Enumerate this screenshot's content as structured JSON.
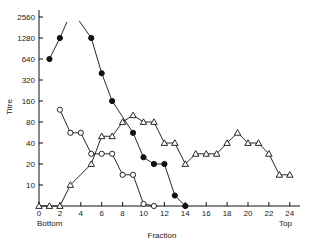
{
  "chart_data": {
    "type": "line",
    "title": "",
    "xlabel": "Fraction",
    "ylabel": "Titre",
    "x_end_labels": {
      "left": "Bottom",
      "right": "Top"
    },
    "x_ticks": [
      0,
      2,
      4,
      6,
      8,
      10,
      12,
      14,
      16,
      18,
      20,
      22,
      24
    ],
    "y_ticks": [
      "0",
      "10",
      "20",
      "40",
      "80",
      "160",
      "320",
      "640",
      "1280",
      "2560"
    ],
    "y_scale": "log2 (0 at baseline)",
    "xlim": [
      0,
      25
    ],
    "ylim": [
      0,
      2560
    ],
    "grid": false,
    "legend": null,
    "series": [
      {
        "name": "filled circles",
        "marker": "filled-circle",
        "segments": [
          {
            "x": [
              1,
              2
            ],
            "y": [
              640,
              1280
            ],
            "continues_off_scale": "up"
          },
          {
            "x": [
              5,
              6,
              7,
              9,
              10,
              11,
              12,
              13,
              14
            ],
            "y": [
              1280,
              400,
              160,
              56,
              25,
              20,
              20,
              5,
              0
            ],
            "enters_from_off_scale": "up"
          }
        ]
      },
      {
        "name": "open circles",
        "marker": "open-circle",
        "x": [
          2,
          3,
          4,
          5,
          6,
          7,
          8,
          9,
          10,
          11
        ],
        "y": [
          120,
          56,
          56,
          28,
          28,
          28,
          14,
          14,
          1,
          0
        ]
      },
      {
        "name": "open triangles",
        "marker": "open-triangle",
        "x": [
          0,
          1,
          2,
          3,
          5,
          6,
          7,
          8,
          9,
          10,
          11,
          12,
          13,
          14,
          15,
          16,
          17,
          18,
          19,
          20,
          21,
          22,
          23,
          24
        ],
        "y": [
          0,
          0,
          0,
          10,
          20,
          50,
          50,
          80,
          100,
          80,
          80,
          40,
          40,
          20,
          28,
          28,
          28,
          40,
          56,
          40,
          40,
          28,
          14,
          14
        ]
      }
    ]
  }
}
